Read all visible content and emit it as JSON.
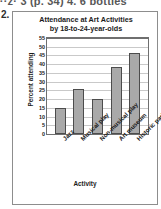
{
  "page": {
    "header_text_fragment": "···z· 3 (p. 34)  4. 6 bottles",
    "problem_number": "2."
  },
  "chart_data": {
    "type": "bar",
    "title": "Attendance at Art Activities",
    "subtitle": "by 18-to-24-year-olds",
    "xlabel": "Activity",
    "ylabel": "Percent attending",
    "categories": [
      "Jazz",
      "Musical play",
      "Non-musical play",
      "Art museum",
      "Historic park"
    ],
    "values": [
      15,
      26,
      20,
      38.5,
      46.5
    ],
    "ylim": [
      0,
      55
    ],
    "ytick_step": 5,
    "yticks": [
      "0",
      "5",
      "10",
      "15",
      "20",
      "25",
      "30",
      "35",
      "40",
      "45",
      "50",
      "55"
    ],
    "grid": true,
    "legend": "none",
    "bar_fill_color": "#a9a9a9",
    "bar_border_color": "#4c4c4c",
    "gridline_color": "#c9c9c9",
    "axis_color": "#6f6f6f"
  }
}
